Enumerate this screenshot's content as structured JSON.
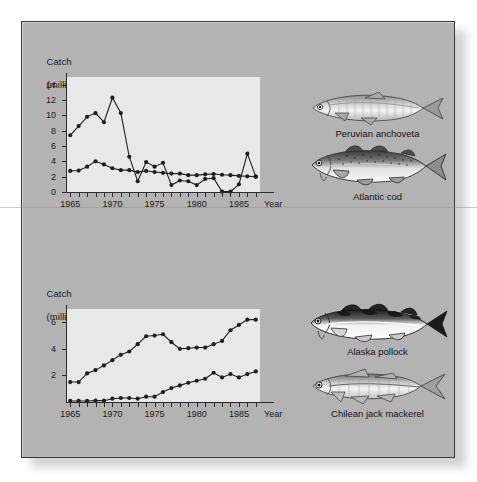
{
  "figure": {
    "background_color": "#b3b3b3",
    "plot_background_color": "#e8e8e8",
    "line_color": "#1f1f1f"
  },
  "charts": {
    "top": {
      "axis_title_line1": "Catch",
      "axis_title_line2": "(million tonnes)",
      "xaxis_name": "Year",
      "ylabels": [
        "0",
        "2",
        "4",
        "6",
        "8",
        "10",
        "12",
        "14"
      ],
      "xlabels": [
        "1965",
        "1970",
        "1975",
        "1980",
        "1985"
      ]
    },
    "bottom": {
      "axis_title_line1": "Catch",
      "axis_title_line2": "(million tonnes)",
      "xaxis_name": "Year",
      "ylabels": [
        "2",
        "4",
        "6"
      ],
      "xlabels": [
        "1965",
        "1970",
        "1975",
        "1980",
        "1985"
      ]
    }
  },
  "fish": [
    {
      "id": "anchoveta",
      "caption": "Peruvian anchoveta",
      "icon": "fish-anchovy-icon"
    },
    {
      "id": "cod",
      "caption": "Atlantic cod",
      "icon": "fish-cod-icon"
    },
    {
      "id": "pollock",
      "caption": "Alaska pollock",
      "icon": "fish-pollock-icon"
    },
    {
      "id": "mackerel",
      "caption": "Chilean jack mackerel",
      "icon": "fish-mackerel-icon"
    }
  ],
  "chart_data": [
    {
      "type": "line",
      "id": "top-chart",
      "title": "Catch (million tonnes)",
      "xlabel": "Year",
      "ylabel": "Catch (million tonnes)",
      "xlim": [
        1964.5,
        1987.5
      ],
      "ylim": [
        0,
        15
      ],
      "yticks": [
        0,
        2,
        4,
        6,
        8,
        10,
        12,
        14
      ],
      "xticks": [
        1965,
        1970,
        1975,
        1980,
        1985
      ],
      "grid": false,
      "legend": "none",
      "x": [
        1965,
        1966,
        1967,
        1968,
        1969,
        1970,
        1971,
        1972,
        1973,
        1974,
        1975,
        1976,
        1977,
        1978,
        1979,
        1980,
        1981,
        1982,
        1983,
        1984,
        1985,
        1986,
        1987
      ],
      "series": [
        {
          "name": "Peruvian anchoveta",
          "values": [
            7.4,
            8.6,
            9.8,
            10.3,
            9.1,
            12.3,
            10.3,
            4.6,
            1.4,
            3.9,
            3.3,
            3.8,
            0.9,
            1.5,
            1.4,
            0.9,
            1.7,
            1.8,
            0.05,
            0.05,
            1.0,
            5.0,
            2.0
          ]
        },
        {
          "name": "Atlantic cod",
          "values": [
            2.75,
            2.8,
            3.3,
            4.0,
            3.6,
            3.1,
            2.85,
            2.85,
            2.6,
            2.75,
            2.6,
            2.5,
            2.4,
            2.4,
            2.2,
            2.2,
            2.3,
            2.35,
            2.25,
            2.2,
            2.1,
            2.05,
            2.0
          ]
        }
      ]
    },
    {
      "type": "line",
      "id": "bottom-chart",
      "title": "Catch (million tonnes)",
      "xlabel": "Year",
      "ylabel": "Catch (million tonnes)",
      "xlim": [
        1964.5,
        1987.5
      ],
      "ylim": [
        0,
        7
      ],
      "yticks": [
        2,
        4,
        6
      ],
      "xticks": [
        1965,
        1970,
        1975,
        1980,
        1985
      ],
      "grid": false,
      "legend": "none",
      "x": [
        1965,
        1966,
        1967,
        1968,
        1969,
        1970,
        1971,
        1972,
        1973,
        1974,
        1975,
        1976,
        1977,
        1978,
        1979,
        1980,
        1981,
        1982,
        1983,
        1984,
        1985,
        1986,
        1987
      ],
      "series": [
        {
          "name": "Alaska pollock",
          "values": [
            1.5,
            1.5,
            2.15,
            2.4,
            2.75,
            3.15,
            3.55,
            3.8,
            4.35,
            4.95,
            5.0,
            5.1,
            4.5,
            4.0,
            4.05,
            4.1,
            4.1,
            4.35,
            4.6,
            5.4,
            5.8,
            6.2,
            6.2
          ]
        },
        {
          "name": "Chilean jack mackerel",
          "values": [
            0.08,
            0.08,
            0.08,
            0.1,
            0.1,
            0.25,
            0.3,
            0.3,
            0.25,
            0.4,
            0.4,
            0.75,
            1.05,
            1.25,
            1.45,
            1.6,
            1.75,
            2.2,
            1.85,
            2.1,
            1.85,
            2.1,
            2.3
          ]
        }
      ]
    }
  ]
}
